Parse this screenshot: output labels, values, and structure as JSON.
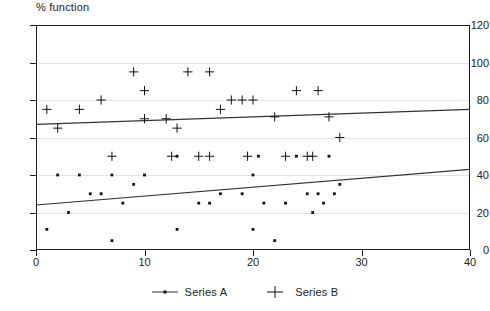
{
  "chart_data": {
    "type": "scatter",
    "title": "% function",
    "xlabel": "",
    "ylabel": "",
    "xlim": [
      0,
      40
    ],
    "ylim": [
      0,
      120
    ],
    "xticks": [
      0,
      10,
      20,
      30,
      40
    ],
    "yticks": [
      0,
      20,
      40,
      60,
      80,
      100,
      120
    ],
    "grid": true,
    "legend_position": "bottom-center",
    "series": [
      {
        "name": "Series A",
        "marker": "dot",
        "points": [
          [
            1,
            11
          ],
          [
            2,
            40
          ],
          [
            3,
            20
          ],
          [
            4,
            40
          ],
          [
            5,
            30
          ],
          [
            6,
            30
          ],
          [
            7,
            5
          ],
          [
            7,
            40
          ],
          [
            8,
            25
          ],
          [
            9,
            35
          ],
          [
            10,
            40
          ],
          [
            13,
            11
          ],
          [
            13,
            50
          ],
          [
            15,
            25
          ],
          [
            16,
            25
          ],
          [
            17,
            30
          ],
          [
            19,
            30
          ],
          [
            20,
            40
          ],
          [
            20,
            11
          ],
          [
            21,
            25
          ],
          [
            22,
            5
          ],
          [
            23,
            25
          ],
          [
            24,
            50
          ],
          [
            25,
            30
          ],
          [
            26,
            30
          ],
          [
            27,
            50
          ],
          [
            28,
            35
          ],
          [
            20.5,
            50
          ],
          [
            25.5,
            20
          ],
          [
            26.5,
            25
          ],
          [
            27.5,
            30
          ]
        ],
        "trendline": {
          "x": [
            0,
            40
          ],
          "y": [
            24,
            43
          ]
        }
      },
      {
        "name": "Series B",
        "marker": "plus",
        "points": [
          [
            1,
            75
          ],
          [
            2,
            65
          ],
          [
            4,
            75
          ],
          [
            6,
            80
          ],
          [
            7,
            50
          ],
          [
            9,
            95
          ],
          [
            10,
            85
          ],
          [
            10,
            70
          ],
          [
            12,
            70
          ],
          [
            13,
            65
          ],
          [
            14,
            95
          ],
          [
            15,
            50
          ],
          [
            16,
            50
          ],
          [
            16,
            95
          ],
          [
            17,
            75
          ],
          [
            18,
            80
          ],
          [
            19,
            80
          ],
          [
            20,
            80
          ],
          [
            22,
            71
          ],
          [
            23,
            50
          ],
          [
            24,
            85
          ],
          [
            25,
            50
          ],
          [
            25.5,
            50
          ],
          [
            26,
            85
          ],
          [
            27,
            71
          ],
          [
            28,
            60
          ],
          [
            12.5,
            50
          ],
          [
            19.5,
            50
          ]
        ],
        "trendline": {
          "x": [
            0,
            40
          ],
          "y": [
            67,
            75
          ]
        }
      }
    ]
  },
  "legend": {
    "items": [
      {
        "label": "Series A",
        "marker": "line-dot"
      },
      {
        "label": "Series B",
        "marker": "plus"
      }
    ]
  },
  "colors": {
    "axis": "#1c1c1c",
    "grid": "#e2e2e2",
    "marker": "#111111",
    "trendline": "#333333",
    "text": "#222222",
    "background": "#ffffff"
  }
}
